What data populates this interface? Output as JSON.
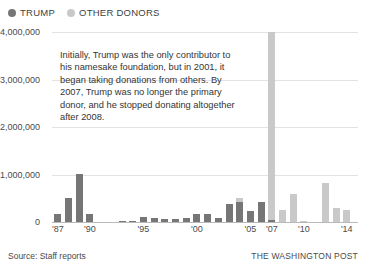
{
  "legend": {
    "entries": [
      {
        "label": "TRUMP",
        "color": "#767676",
        "key": "trump"
      },
      {
        "label": "OTHER DONORS",
        "color": "#c9c9c9",
        "key": "other"
      }
    ]
  },
  "annotation": {
    "text": "Initially, Trump was the only contributor to his namesake foundation, but in 2001, it began taking donations from others. By 2007, Trump was no longer the primary donor, and he stopped donating altogether after 2008."
  },
  "footer": {
    "source": "Source: Staff reports",
    "credit": "THE WASHINGTON POST"
  },
  "axis": {
    "y_ticks": [
      {
        "value": 0,
        "label": "0"
      },
      {
        "value": 1000000,
        "label": "1,000,000"
      },
      {
        "value": 2000000,
        "label": "2,000,000"
      },
      {
        "value": 3000000,
        "label": "3,000,000"
      },
      {
        "value": 4000000,
        "label": "4,000,000"
      }
    ],
    "x_ticks": [
      {
        "year": 1987,
        "label": "'87"
      },
      {
        "year": 1990,
        "label": "'90"
      },
      {
        "year": 1995,
        "label": "'95"
      },
      {
        "year": 2000,
        "label": "'00"
      },
      {
        "year": 2005,
        "label": "'05"
      },
      {
        "year": 2007,
        "label": "'07"
      },
      {
        "year": 2010,
        "label": "'10"
      },
      {
        "year": 2014,
        "label": "'14"
      }
    ]
  },
  "chart_data": {
    "type": "bar",
    "subtype": "stacked-vertical",
    "title": "",
    "subtitle": "",
    "xlabel": "",
    "ylabel": "",
    "ylim": [
      0,
      4000000
    ],
    "grid": true,
    "legend_position": "top-left",
    "categories": [
      "1987",
      "1988",
      "1989",
      "1990",
      "1991",
      "1992",
      "1993",
      "1994",
      "1995",
      "1996",
      "1997",
      "1998",
      "1999",
      "2000",
      "2001",
      "2002",
      "2003",
      "2004",
      "2005",
      "2006",
      "2007",
      "2008",
      "2009",
      "2010",
      "2011",
      "2012",
      "2013",
      "2014"
    ],
    "series": [
      {
        "name": "TRUMP",
        "color": "#767676",
        "values": [
          170000,
          500000,
          1020000,
          160000,
          0,
          0,
          30000,
          28000,
          105000,
          95000,
          55000,
          60000,
          95000,
          170000,
          175000,
          90000,
          375000,
          420000,
          230000,
          425000,
          35000,
          0,
          0,
          0,
          0,
          0,
          0,
          0
        ]
      },
      {
        "name": "OTHER DONORS",
        "color": "#c9c9c9",
        "values": [
          0,
          0,
          0,
          0,
          0,
          0,
          0,
          0,
          0,
          0,
          0,
          0,
          0,
          0,
          0,
          0,
          0,
          80000,
          0,
          0,
          3965000,
          245000,
          600000,
          15000,
          0,
          825000,
          290000,
          250000
        ]
      }
    ],
    "notes": [
      "Tall light-gray bar at 2007 reaches the 4,000,000 gridline.",
      "Trump (dark) bars end after 2008; later years are other donors only."
    ]
  }
}
